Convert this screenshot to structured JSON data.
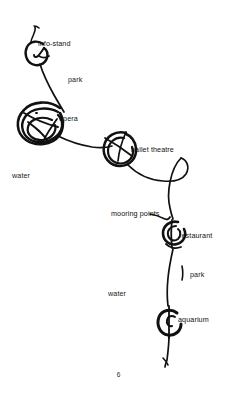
{
  "document": {
    "kind": "hand-drawn-sketch-map",
    "page_number": "6",
    "background_color": "#ffffff",
    "ink_color": "#111111"
  },
  "map": {
    "place_labels": [
      {
        "id": "info-stand",
        "text": "info-stand",
        "marker": "circle-loop"
      },
      {
        "id": "opera",
        "text": "opera",
        "marker": "circle-loop"
      },
      {
        "id": "ballet-theatre",
        "text": "ballet theatre",
        "marker": "circle-loop"
      },
      {
        "id": "mooring-points",
        "text": "mooring points",
        "marker": "leader-line"
      },
      {
        "id": "restaurant",
        "text": "restaurant",
        "marker": "circle-loop"
      },
      {
        "id": "aquarium",
        "text": "aquarium",
        "marker": "circle-loop"
      }
    ],
    "area_labels": [
      {
        "id": "park-upper",
        "text": "park"
      },
      {
        "id": "park-lower",
        "text": "park"
      },
      {
        "id": "water-upper",
        "text": "water"
      },
      {
        "id": "water-lower",
        "text": "water"
      }
    ]
  }
}
